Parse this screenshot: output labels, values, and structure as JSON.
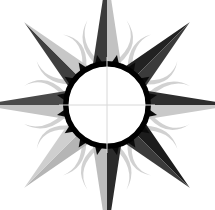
{
  "canvas": {
    "width": 215,
    "height": 210,
    "background_color": "#ffffff",
    "title": "Sun Compass Rose Emblem"
  },
  "emblem": {
    "name": "sun-compass-rose",
    "center": {
      "x": 107,
      "y": 105
    },
    "ring": {
      "outer_radius": 44,
      "inner_radius": 38.5,
      "color": "#000000",
      "inner_fill": "#ffffff",
      "tooth_count": 16,
      "tooth_color": "#0a0a0a",
      "tooth_length": 7,
      "tooth_half_width": 4.5
    },
    "crosshair": {
      "color": "#d8d8d8",
      "stroke_width": 1,
      "horizontal_extent": 48,
      "vertical_extent": 48,
      "visible": true
    },
    "colors": {
      "dark_gray": "#3b3b3b",
      "mid_gray": "#555555",
      "light_gray": "#c2c2c2",
      "pale_gray": "#d5d5d5",
      "black": "#000000",
      "white": "#ffffff",
      "tendril": "#cfcfcf"
    },
    "spikes": [
      {
        "label": "north",
        "angle": -90,
        "length": 92,
        "half_width": 14,
        "left_color": "#3b3b3b",
        "right_color": "#c2c2c2"
      },
      {
        "label": "northeast",
        "angle": -45,
        "length": 76,
        "half_width": 14,
        "left_color": "#222222",
        "right_color": "#3b3b3b"
      },
      {
        "label": "east",
        "angle": 0,
        "length": 88,
        "half_width": 14,
        "left_color": "#2e2e2e",
        "right_color": "#c9c9c9"
      },
      {
        "label": "southeast",
        "angle": 45,
        "length": 76,
        "half_width": 14,
        "left_color": "#1c1c1c",
        "right_color": "#3b3b3b"
      },
      {
        "label": "south",
        "angle": 90,
        "length": 92,
        "half_width": 14,
        "left_color": "#2b2b2b",
        "right_color": "#bdbdbd"
      },
      {
        "label": "southwest",
        "angle": 135,
        "length": 76,
        "half_width": 14,
        "left_color": "#b5b5b5",
        "right_color": "#cfcfcf"
      },
      {
        "label": "west",
        "angle": 180,
        "length": 86,
        "half_width": 14,
        "left_color": "#c4c4c4",
        "right_color": "#4a4a4a"
      },
      {
        "label": "northwest",
        "angle": -135,
        "length": 76,
        "half_width": 14,
        "left_color": "#3f3f3f",
        "right_color": "#c7c7c7"
      }
    ],
    "tendrils": [
      {
        "label": "tendril-n-left",
        "angle": -103,
        "length": 44,
        "curl": -26
      },
      {
        "label": "tendril-n-right",
        "angle": -77,
        "length": 44,
        "curl": 26
      },
      {
        "label": "tendril-ne-left",
        "angle": -58,
        "length": 40,
        "curl": -24
      },
      {
        "label": "tendril-ne-right",
        "angle": -32,
        "length": 40,
        "curl": 24
      },
      {
        "label": "tendril-e-left",
        "angle": -13,
        "length": 42,
        "curl": -24
      },
      {
        "label": "tendril-e-right",
        "angle": 13,
        "length": 42,
        "curl": 24
      },
      {
        "label": "tendril-se-left",
        "angle": 32,
        "length": 40,
        "curl": -24
      },
      {
        "label": "tendril-se-right",
        "angle": 58,
        "length": 40,
        "curl": 24
      },
      {
        "label": "tendril-s-left",
        "angle": 77,
        "length": 44,
        "curl": -26
      },
      {
        "label": "tendril-s-right",
        "angle": 103,
        "length": 44,
        "curl": 26
      },
      {
        "label": "tendril-sw-left",
        "angle": 122,
        "length": 40,
        "curl": -24
      },
      {
        "label": "tendril-sw-right",
        "angle": 148,
        "length": 40,
        "curl": 24
      },
      {
        "label": "tendril-w-left",
        "angle": 167,
        "length": 42,
        "curl": -24
      },
      {
        "label": "tendril-w-right",
        "angle": 193,
        "length": 42,
        "curl": 24
      },
      {
        "label": "tendril-nw-left",
        "angle": -148,
        "length": 40,
        "curl": -24
      },
      {
        "label": "tendril-nw-right",
        "angle": -122,
        "length": 40,
        "curl": 24
      }
    ]
  }
}
